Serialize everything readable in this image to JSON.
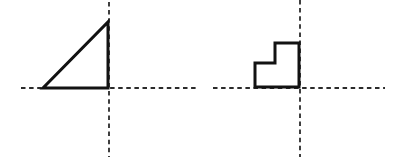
{
  "canvas": {
    "width": 415,
    "height": 168,
    "background": "#ffffff"
  },
  "colors": {
    "shape_outline": "#121212",
    "dashed_line": "#2b2b2b"
  },
  "style": {
    "solid_stroke_width": 3,
    "dashed_stroke_width": 1.8,
    "dash_pattern": "4.5 3.6"
  },
  "figures": [
    {
      "name": "triangle-figure",
      "shape_kind": "right-triangle",
      "axes": {
        "vertical_dashed_line": {
          "x": 109,
          "y1": 2,
          "y2": 157
        },
        "horizontal_dashed_line": {
          "y": 88,
          "x1": 21,
          "x2": 198
        }
      },
      "shape": {
        "type": "polygon",
        "points": [
          [
            43,
            88
          ],
          [
            108,
            88
          ],
          [
            108,
            22
          ]
        ]
      }
    },
    {
      "name": "step-figure",
      "shape_kind": "step-l-shape",
      "axes": {
        "vertical_dashed_line": {
          "x": 300,
          "y1": 0,
          "y2": 157
        },
        "horizontal_dashed_line": {
          "y": 88,
          "x1": 213,
          "x2": 385
        }
      },
      "shape": {
        "type": "polygon",
        "points": [
          [
            255,
            87
          ],
          [
            255,
            63
          ],
          [
            275,
            63
          ],
          [
            275,
            43
          ],
          [
            299,
            43
          ],
          [
            299,
            87
          ]
        ]
      }
    }
  ]
}
